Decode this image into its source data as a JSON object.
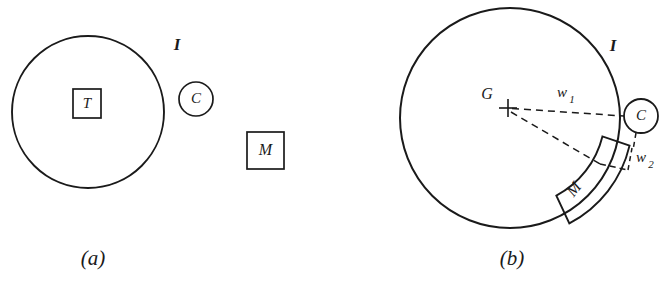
{
  "figure": {
    "type": "technical-diagram",
    "background_color": "#ffffff",
    "line_color": "#1a1a1a",
    "panels": [
      {
        "id": "a",
        "caption": "(a)",
        "caption_pos": {
          "x": 93,
          "y": 265
        },
        "description": "Separated configuration: inner square T inside large circle I, small circle C outside touching, square M at right",
        "elements": {
          "interface_circle": {
            "label": "I",
            "label_pos": {
              "x": 177,
              "y": 46
            },
            "cx": 88,
            "cy": 112,
            "r": 76
          },
          "target_box": {
            "label": "T",
            "x": 73,
            "y": 89,
            "w": 28,
            "h": 29
          },
          "coil_circle": {
            "label": "C",
            "cx": 196,
            "cy": 99,
            "r": 17
          },
          "magnet_box": {
            "label": "M",
            "x": 247,
            "y": 132,
            "w": 37,
            "h": 37
          }
        }
      },
      {
        "id": "b",
        "caption": "(b)",
        "caption_pos": {
          "x": 512,
          "y": 265
        },
        "description": "Engaged configuration: large circle I with centre mark G, arc-shaped magnet M on the lower-right rim, small circle C outside, distances w1 and w2 marked with dashed leader lines",
        "elements": {
          "interface_circle": {
            "label": "I",
            "label_pos": {
              "x": 613,
              "y": 47
            },
            "cx": 510,
            "cy": 118,
            "r": 110
          },
          "center_mark": {
            "label": "G",
            "label_pos": {
              "x": 487,
              "y": 95
            },
            "x": 508,
            "y": 108
          },
          "coil_circle": {
            "label": "C",
            "cx": 641,
            "cy": 116,
            "r": 17
          },
          "magnet_arc": {
            "label": "M",
            "label_pos": {
              "x": 575,
              "y": 189
            }
          },
          "dimension_1": {
            "label": "w",
            "subscript": "1",
            "label_pos": {
              "x": 566,
              "y": 94
            }
          },
          "dimension_2": {
            "label": "w",
            "subscript": "2",
            "label_pos": {
              "x": 643,
              "y": 160
            }
          }
        }
      }
    ]
  }
}
